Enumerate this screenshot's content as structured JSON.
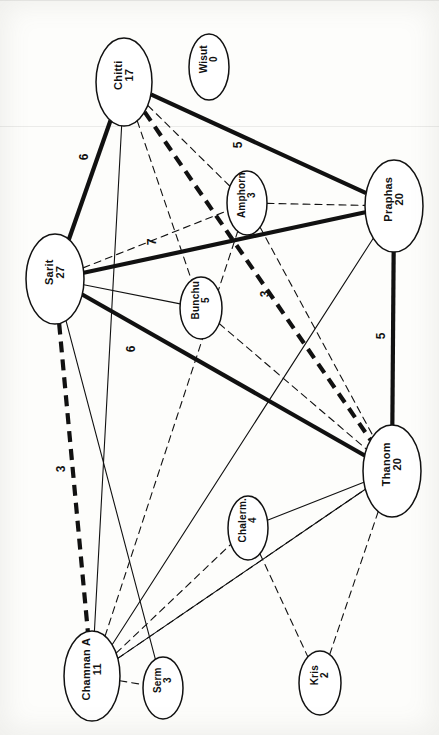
{
  "diagram": {
    "type": "node-link-network",
    "orientation": "labels rotated 90 degrees counter-clockwise",
    "canvas": {
      "width": 439,
      "height": 735
    },
    "background_color": "#fdfdfb",
    "ink_color": "#111111"
  },
  "legend": {
    "line_styles": [
      {
        "key": "bold-solid",
        "meaning": "strongest tie"
      },
      {
        "key": "bold-dashed",
        "meaning": "strong intermittent tie"
      },
      {
        "key": "thin-solid",
        "meaning": "ordinary tie"
      },
      {
        "key": "thin-dashed",
        "meaning": "weak tie"
      }
    ]
  },
  "nodes": [
    {
      "id": "chitti",
      "name": "Chitti",
      "value": "17",
      "cx": 124,
      "cy": 82,
      "rx": 28,
      "ry": 44,
      "font": 11
    },
    {
      "id": "wisut",
      "name": "Wisut",
      "value": "0",
      "cx": 209,
      "cy": 67,
      "rx": 20,
      "ry": 33,
      "font": 10
    },
    {
      "id": "sarit",
      "name": "Sarit",
      "value": "27",
      "cx": 55,
      "cy": 279,
      "rx": 29,
      "ry": 45,
      "font": 11
    },
    {
      "id": "praphas",
      "name": "Praphas",
      "value": "20",
      "cx": 394,
      "cy": 206,
      "rx": 29,
      "ry": 46,
      "font": 11
    },
    {
      "id": "amphorn",
      "name": "Amphorn",
      "value": "3",
      "cx": 247,
      "cy": 203,
      "rx": 20,
      "ry": 32,
      "font": 10
    },
    {
      "id": "bunchu",
      "name": "Bunchu",
      "value": "5",
      "cx": 201,
      "cy": 308,
      "rx": 21,
      "ry": 31,
      "font": 10
    },
    {
      "id": "thanom",
      "name": "Thanom",
      "value": "20",
      "cx": 392,
      "cy": 471,
      "rx": 29,
      "ry": 46,
      "font": 11
    },
    {
      "id": "chalerm",
      "name": "Chalerm.",
      "value": "4",
      "cx": 248,
      "cy": 528,
      "rx": 20,
      "ry": 32,
      "font": 10
    },
    {
      "id": "chamnan",
      "name": "Chamnan A",
      "value": "11",
      "cx": 92,
      "cy": 676,
      "rx": 28,
      "ry": 45,
      "font": 11
    },
    {
      "id": "serm",
      "name": "Serm",
      "value": "3",
      "cx": 163,
      "cy": 688,
      "rx": 20,
      "ry": 31,
      "font": 10
    },
    {
      "id": "kris",
      "name": "Kris",
      "value": "2",
      "cx": 320,
      "cy": 683,
      "rx": 21,
      "ry": 32,
      "font": 10
    }
  ],
  "edges": [
    {
      "source": "chitti",
      "target": "sarit",
      "style": "bold-solid",
      "weight": "6"
    },
    {
      "source": "chitti",
      "target": "praphas",
      "style": "bold-solid",
      "weight": "5"
    },
    {
      "source": "sarit",
      "target": "praphas",
      "style": "bold-solid",
      "weight": "7"
    },
    {
      "source": "sarit",
      "target": "thanom",
      "style": "bold-solid",
      "weight": "6"
    },
    {
      "source": "praphas",
      "target": "thanom",
      "style": "bold-solid",
      "weight": "5"
    },
    {
      "source": "chitti",
      "target": "thanom",
      "style": "bold-dashed",
      "weight": "3"
    },
    {
      "source": "sarit",
      "target": "chamnan",
      "style": "bold-dashed",
      "weight": "3"
    },
    {
      "source": "sarit",
      "target": "bunchu",
      "style": "thin-solid",
      "weight": ""
    },
    {
      "source": "sarit",
      "target": "serm",
      "style": "thin-solid",
      "weight": ""
    },
    {
      "source": "chitti",
      "target": "chamnan",
      "style": "thin-solid",
      "weight": ""
    },
    {
      "source": "praphas",
      "target": "chamnan",
      "style": "thin-solid",
      "weight": ""
    },
    {
      "source": "thanom",
      "target": "chalerm",
      "style": "thin-solid",
      "weight": ""
    },
    {
      "source": "thanom",
      "target": "chamnan",
      "style": "thin-solid",
      "weight": ""
    },
    {
      "source": "chitti",
      "target": "bunchu",
      "style": "thin-dashed",
      "weight": ""
    },
    {
      "source": "chitti",
      "target": "amphorn",
      "style": "thin-dashed",
      "weight": ""
    },
    {
      "source": "sarit",
      "target": "amphorn",
      "style": "thin-dashed",
      "weight": ""
    },
    {
      "source": "amphorn",
      "target": "praphas",
      "style": "thin-dashed",
      "weight": ""
    },
    {
      "source": "amphorn",
      "target": "thanom",
      "style": "thin-dashed",
      "weight": ""
    },
    {
      "source": "bunchu",
      "target": "thanom",
      "style": "thin-dashed",
      "weight": ""
    },
    {
      "source": "chamnan",
      "target": "serm",
      "style": "thin-dashed",
      "weight": ""
    },
    {
      "source": "chamnan",
      "target": "amphorn",
      "style": "thin-dashed",
      "weight": ""
    },
    {
      "source": "chamnan",
      "target": "chalerm",
      "style": "thin-dashed",
      "weight": ""
    },
    {
      "source": "chamnan",
      "target": "thanom",
      "style": "thin-dashed",
      "weight": ""
    },
    {
      "source": "chalerm",
      "target": "kris",
      "style": "thin-dashed",
      "weight": ""
    },
    {
      "source": "thanom",
      "target": "kris",
      "style": "thin-dashed",
      "weight": ""
    }
  ],
  "edge_labels": [
    {
      "text": "6",
      "x": 84,
      "y": 158,
      "rot": -90
    },
    {
      "text": "5",
      "x": 238,
      "y": 146,
      "rot": -90
    },
    {
      "text": "7",
      "x": 152,
      "y": 243,
      "rot": -90
    },
    {
      "text": "3",
      "x": 265,
      "y": 295,
      "rot": -90
    },
    {
      "text": "6",
      "x": 131,
      "y": 350,
      "rot": -90
    },
    {
      "text": "5",
      "x": 381,
      "y": 337,
      "rot": -90
    },
    {
      "text": "3",
      "x": 61,
      "y": 470,
      "rot": -90
    }
  ]
}
